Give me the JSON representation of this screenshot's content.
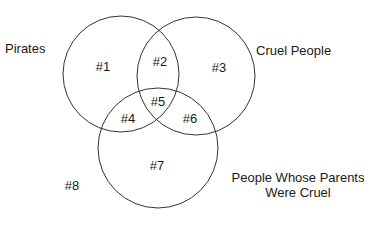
{
  "diagram": {
    "type": "venn",
    "sets": [
      {
        "id": "A",
        "label": "Pirates",
        "cx": 121,
        "cy": 74,
        "r": 58
      },
      {
        "id": "B",
        "label": "Cruel People",
        "cx": 196,
        "cy": 76,
        "r": 59
      },
      {
        "id": "C",
        "label": "People Whose Parents Were Cruel",
        "label_line1": "People Whose Parents",
        "label_line2": "Were Cruel",
        "cx": 158,
        "cy": 148,
        "r": 60
      }
    ],
    "regions": [
      {
        "label": "#1",
        "x": 103,
        "y": 66
      },
      {
        "label": "#2",
        "x": 160,
        "y": 61
      },
      {
        "label": "#3",
        "x": 219,
        "y": 67
      },
      {
        "label": "#5",
        "x": 158,
        "y": 101
      },
      {
        "label": "#4",
        "x": 128,
        "y": 118
      },
      {
        "label": "#6",
        "x": 190,
        "y": 118
      },
      {
        "label": "#7",
        "x": 157,
        "y": 165
      },
      {
        "label": "#8",
        "x": 72,
        "y": 185
      }
    ],
    "line_color": "#333333"
  }
}
